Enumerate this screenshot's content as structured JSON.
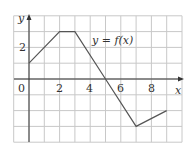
{
  "chart_data": {
    "type": "line",
    "title": "y = f(x)",
    "xlabel": "x",
    "ylabel": "y",
    "x": [
      0,
      2,
      3,
      5,
      7,
      9
    ],
    "series": [
      {
        "name": "y = f(x)",
        "values": [
          1,
          3,
          3,
          0,
          -3,
          -2
        ]
      }
    ],
    "xlim": [
      -1,
      10
    ],
    "ylim": [
      -4,
      4
    ],
    "grid": true,
    "x_ticks": [
      "0",
      "2",
      "4",
      "6",
      "8"
    ],
    "y_ticks": [
      "2"
    ]
  },
  "labels": {
    "origin": "0",
    "x2": "2",
    "x4": "4",
    "x6": "6",
    "x8": "8",
    "y2": "2",
    "xaxis": "x",
    "yaxis": "y",
    "curve": "y = f(x)"
  },
  "colors": {
    "grid": "#c8c8c8",
    "axis": "#333333",
    "curve": "#555555"
  }
}
